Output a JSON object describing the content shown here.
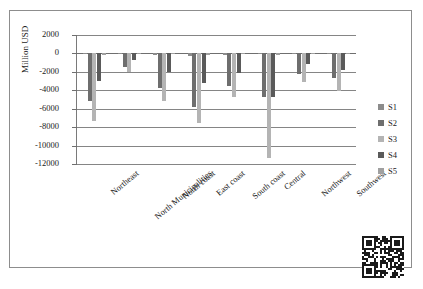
{
  "figure": {
    "top_partial_text": "",
    "caption": ""
  },
  "chart_data": {
    "type": "bar",
    "title": "",
    "xlabel": "",
    "ylabel": "Million USD",
    "ylim": [
      -12000,
      2000
    ],
    "yticks": [
      2000,
      0,
      -2000,
      -4000,
      -6000,
      -8000,
      -10000,
      -12000
    ],
    "ytick_labels": [
      "2000",
      "0",
      "-2000",
      "-4000",
      "-6000",
      "-8000",
      "-10000",
      "-12000"
    ],
    "grid": true,
    "legend_position": "right",
    "categories": [
      "Northeast",
      "North Municipalities",
      "North coast",
      "East coast",
      "South coast",
      "Central",
      "Northwest",
      "Southwest"
    ],
    "series": [
      {
        "name": "S1",
        "color": "#8c8c8c",
        "values": [
          -100,
          -50,
          -150,
          -250,
          -150,
          -100,
          -100,
          -100
        ]
      },
      {
        "name": "S2",
        "color": "#6e6e6e",
        "values": [
          -5200,
          -1500,
          -3800,
          -5800,
          -3500,
          -4700,
          -2200,
          -2700
        ]
      },
      {
        "name": "S3",
        "color": "#b4b4b4",
        "values": [
          -7300,
          -2000,
          -5200,
          -7600,
          -4700,
          -11400,
          -3100,
          -4100
        ]
      },
      {
        "name": "S4",
        "color": "#5a5a5a",
        "values": [
          -3000,
          -700,
          -2000,
          -3200,
          -2100,
          -4700,
          -1100,
          -1800
        ]
      },
      {
        "name": "S5",
        "color": "#a0a0a0",
        "values": [
          -200,
          -100,
          -100,
          -200,
          -100,
          -150,
          -100,
          -100
        ]
      }
    ]
  },
  "legend": {
    "items": [
      {
        "label": "S1"
      },
      {
        "label": "S2"
      },
      {
        "label": "S3"
      },
      {
        "label": "S4"
      },
      {
        "label": "S5"
      }
    ]
  },
  "qr": {
    "name": "qr-code"
  }
}
